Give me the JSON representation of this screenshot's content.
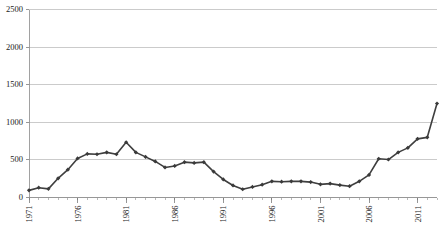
{
  "chart_data": {
    "type": "line",
    "title": "",
    "subtitle": "",
    "xlabel": "",
    "ylabel": "",
    "ylim": [
      0,
      2500
    ],
    "xlim": [
      1971,
      2013
    ],
    "yticks": [
      0,
      500,
      1000,
      1500,
      2000,
      2500
    ],
    "ytick_labels": [
      "0",
      "500",
      "1000",
      "1500",
      "2000",
      "2500"
    ],
    "xticks": [
      1971,
      1976,
      1981,
      1986,
      1991,
      1996,
      2001,
      2006,
      2011
    ],
    "xtick_labels": [
      "1971",
      "1976",
      "1981",
      "1986",
      "1991",
      "1996",
      "2001",
      "2006",
      "2011"
    ],
    "x_minor_tick_step": 1,
    "grid": "horizontal",
    "legend": "none",
    "marker": "diamond",
    "line_color": "#3f3f3f",
    "marker_color": "#3a3a3a",
    "grid_color": "#b5b5b5",
    "axis_color": "#8a8a8a",
    "x": [
      1971,
      1972,
      1973,
      1974,
      1975,
      1976,
      1977,
      1978,
      1979,
      1980,
      1981,
      1982,
      1983,
      1984,
      1985,
      1986,
      1987,
      1988,
      1989,
      1990,
      1991,
      1992,
      1993,
      1994,
      1995,
      1996,
      1997,
      1998,
      1999,
      2000,
      2001,
      2002,
      2003,
      2004,
      2005,
      2006,
      2007,
      2008,
      2009,
      2010,
      2011,
      2012,
      2013
    ],
    "values": [
      95,
      130,
      115,
      255,
      370,
      520,
      580,
      575,
      600,
      575,
      735,
      600,
      540,
      480,
      400,
      420,
      470,
      460,
      470,
      345,
      240,
      160,
      110,
      140,
      170,
      215,
      210,
      215,
      215,
      205,
      175,
      185,
      165,
      150,
      215,
      300,
      515,
      505,
      600,
      660,
      780,
      800,
      1250
    ],
    "series_note": "single series, diamond markers at each yearly point"
  },
  "axis": {
    "y_unit": "",
    "x_unit": "year"
  }
}
